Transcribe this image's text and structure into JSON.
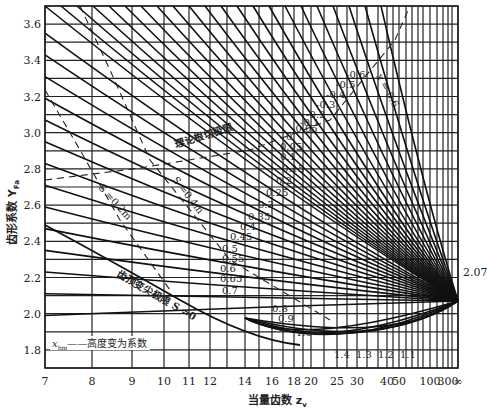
{
  "chart_data": {
    "type": "line",
    "title": "",
    "xlabel": "当量齿数 z_v",
    "ylabel": "齿形系数 Y_Fa",
    "x_scale": "reciprocal-like (nonlinear)",
    "x_ticks": [
      "7",
      "8",
      "9",
      "10",
      "11",
      "12",
      "14",
      "16",
      "18",
      "20",
      "25",
      "30",
      "40",
      "50",
      "100",
      "300",
      "∞"
    ],
    "y_ticks": [
      "1.8",
      "2.0",
      "2.2",
      "2.4",
      "2.6",
      "2.8",
      "3.0",
      "3.2",
      "3.4",
      "3.6"
    ],
    "ylim": [
      1.7,
      3.7
    ],
    "grid": true,
    "convergence_point": {
      "z": "∞",
      "Y": 2.07,
      "label": "2.07"
    },
    "series_family": "x_hm (高度变为系数)",
    "series_labels": [
      "-0.6",
      "-0.5",
      "-0.4",
      "-0.3",
      "-0.2",
      "-0.1",
      "-0.05",
      "0",
      "0.05",
      "0.1",
      "0.15",
      "0.2",
      "0.25",
      "0.3",
      "0.35",
      "0.4",
      "0.45",
      "0.5",
      "0.55",
      "0.6",
      "0.65",
      "0.7",
      "0.8",
      "0.9",
      "1.0",
      "1.1",
      "1.2",
      "1.3",
      "1.4"
    ],
    "annotations": [
      {
        "text": "理论根切极限",
        "type": "dashed boundary"
      },
      {
        "text": "S_a=0.4m_n",
        "type": "dashed boundary"
      },
      {
        "text": "S_a=0.2m_n",
        "type": "dashed boundary"
      },
      {
        "text": "齿顶变尖极限 S_a=0",
        "type": "solid boundary"
      },
      {
        "text": "x_hm —— 高度变为系数",
        "type": "legend"
      },
      {
        "text": "x_hm=-0.6",
        "type": "curve label"
      }
    ]
  },
  "labels": {
    "ylabel": "齿形系数 Y",
    "ylabel_sub": "Fa",
    "xlabel": "当量齿数 z",
    "xlabel_sub": "v",
    "convergence": "2.07",
    "legend": "——高度变为系数",
    "legend_sym": "x",
    "legend_sub": "hm",
    "undercut": "理论根切极限",
    "sa04": "S =0.4m",
    "sa02": "S =0.2m",
    "tip": "齿顶变尖极限 S =0",
    "xhm_top": "x  =-0.6"
  }
}
